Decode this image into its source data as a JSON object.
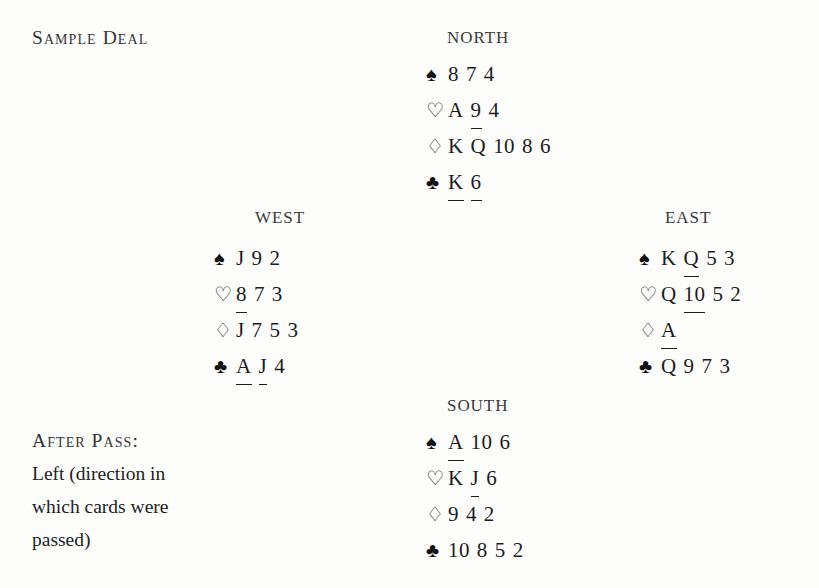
{
  "title": "Sample Deal",
  "suits": {
    "spade": {
      "glyph": "♠",
      "fill": "black"
    },
    "heart": {
      "glyph": "♡",
      "fill": "white"
    },
    "diamond": {
      "glyph": "♢",
      "fill": "white"
    },
    "club": {
      "glyph": "♣",
      "fill": "black"
    }
  },
  "hands": {
    "north": {
      "label": "NORTH",
      "spades": [
        {
          "rank": "8",
          "marked": false
        },
        {
          "rank": "7",
          "marked": false
        },
        {
          "rank": "4",
          "marked": false
        }
      ],
      "hearts": [
        {
          "rank": "A",
          "marked": false
        },
        {
          "rank": "9",
          "marked": true
        },
        {
          "rank": "4",
          "marked": false
        }
      ],
      "diamonds": [
        {
          "rank": "K",
          "marked": false
        },
        {
          "rank": "Q",
          "marked": false
        },
        {
          "rank": "10",
          "marked": false
        },
        {
          "rank": "8",
          "marked": false
        },
        {
          "rank": "6",
          "marked": false
        }
      ],
      "clubs": [
        {
          "rank": "K",
          "marked": true
        },
        {
          "rank": "6",
          "marked": true
        }
      ]
    },
    "west": {
      "label": "WEST",
      "spades": [
        {
          "rank": "J",
          "marked": false
        },
        {
          "rank": "9",
          "marked": false
        },
        {
          "rank": "2",
          "marked": false
        }
      ],
      "hearts": [
        {
          "rank": "8",
          "marked": true
        },
        {
          "rank": "7",
          "marked": false
        },
        {
          "rank": "3",
          "marked": false
        }
      ],
      "diamonds": [
        {
          "rank": "J",
          "marked": false
        },
        {
          "rank": "7",
          "marked": false
        },
        {
          "rank": "5",
          "marked": false
        },
        {
          "rank": "3",
          "marked": false
        }
      ],
      "clubs": [
        {
          "rank": "A",
          "marked": true
        },
        {
          "rank": "J",
          "marked": true
        },
        {
          "rank": "4",
          "marked": false
        }
      ]
    },
    "east": {
      "label": "EAST",
      "spades": [
        {
          "rank": "K",
          "marked": false
        },
        {
          "rank": "Q",
          "marked": true
        },
        {
          "rank": "5",
          "marked": false
        },
        {
          "rank": "3",
          "marked": false
        }
      ],
      "hearts": [
        {
          "rank": "Q",
          "marked": false
        },
        {
          "rank": "10",
          "marked": true
        },
        {
          "rank": "5",
          "marked": false
        },
        {
          "rank": "2",
          "marked": false
        }
      ],
      "diamonds": [
        {
          "rank": "A",
          "marked": true
        }
      ],
      "clubs": [
        {
          "rank": "Q",
          "marked": false
        },
        {
          "rank": "9",
          "marked": false
        },
        {
          "rank": "7",
          "marked": false
        },
        {
          "rank": "3",
          "marked": false
        }
      ]
    },
    "south": {
      "label": "SOUTH",
      "spades": [
        {
          "rank": "A",
          "marked": true
        },
        {
          "rank": "10",
          "marked": false
        },
        {
          "rank": "6",
          "marked": false
        }
      ],
      "hearts": [
        {
          "rank": "K",
          "marked": false
        },
        {
          "rank": "J",
          "marked": true
        },
        {
          "rank": "6",
          "marked": false
        }
      ],
      "diamonds": [
        {
          "rank": "9",
          "marked": false
        },
        {
          "rank": "4",
          "marked": false
        },
        {
          "rank": "2",
          "marked": false
        }
      ],
      "clubs": [
        {
          "rank": "10",
          "marked": false
        },
        {
          "rank": "8",
          "marked": false
        },
        {
          "rank": "5",
          "marked": false
        },
        {
          "rank": "2",
          "marked": false
        }
      ]
    }
  },
  "caption": {
    "heading": "After Pass:",
    "lines": [
      "Left (direction in",
      "which cards were",
      "passed)"
    ]
  }
}
